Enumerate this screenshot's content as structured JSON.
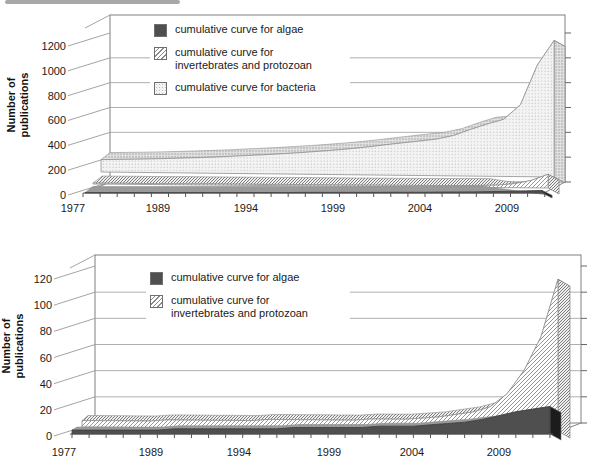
{
  "y_axis_title_lines": [
    "Number of",
    "publications"
  ],
  "chart_data": [
    {
      "type": "area",
      "style": "3d-layered-cumulative",
      "title": "",
      "ylabel": "Number of publications",
      "ylim": [
        0,
        1200
      ],
      "y_ticks": [
        0,
        200,
        400,
        600,
        800,
        1000,
        1200
      ],
      "x_tick_year_labels": [
        "1977",
        "1989",
        "1994",
        "1999",
        "2004",
        "2009"
      ],
      "grid": true,
      "legend_position": "inside-top-left",
      "series": [
        {
          "key": "bacteria",
          "name": "cumulative curve for bacteria",
          "pattern": "dots",
          "values": [
            100,
            103,
            106,
            110,
            115,
            120,
            126,
            132,
            140,
            148,
            156,
            165,
            175,
            186,
            198,
            212,
            228,
            245,
            262,
            278,
            295,
            325,
            375,
            420,
            460,
            580,
            900,
            1100
          ]
        },
        {
          "key": "invertebrates",
          "name": "cumulative curve for invertebrates and protozoan",
          "pattern": "hatch",
          "values": [
            8,
            8,
            8,
            8,
            8,
            9,
            9,
            9,
            9,
            9,
            9,
            10,
            10,
            10,
            10,
            10,
            10,
            11,
            11,
            11,
            12,
            13,
            14,
            16,
            20,
            32,
            60,
            110
          ]
        },
        {
          "key": "algae",
          "name": "cumulative curve for algae",
          "pattern": "solid-dark",
          "values": [
            3,
            3,
            3,
            3,
            3,
            3,
            4,
            4,
            4,
            4,
            4,
            4,
            4,
            5,
            5,
            5,
            5,
            5,
            6,
            6,
            6,
            7,
            8,
            9,
            11,
            14,
            17,
            20
          ]
        }
      ],
      "legend": [
        {
          "key": "algae",
          "lines": [
            "cumulative curve for algae"
          ]
        },
        {
          "key": "invertebrates",
          "lines": [
            "cumulative curve for",
            "invertebrates and protozoan"
          ]
        },
        {
          "key": "bacteria",
          "lines": [
            "cumulative curve for bacteria"
          ]
        }
      ]
    },
    {
      "type": "area",
      "style": "3d-layered-cumulative",
      "title": "",
      "ylabel": "Number of publications",
      "ylim": [
        0,
        120
      ],
      "y_ticks": [
        0,
        20,
        40,
        60,
        80,
        100,
        120
      ],
      "x_tick_year_labels": [
        "1977",
        "1989",
        "1994",
        "1999",
        "2004",
        "2009"
      ],
      "grid": true,
      "legend_position": "inside-top-left",
      "series": [
        {
          "key": "invertebrates",
          "name": "cumulative curve for invertebrates and protozoan",
          "pattern": "hatch",
          "values": [
            5,
            5,
            5,
            5,
            5,
            6,
            6,
            6,
            6,
            6,
            6,
            7,
            7,
            7,
            7,
            7,
            7,
            8,
            8,
            8,
            9,
            10,
            12,
            14,
            18,
            28,
            46,
            72,
            116
          ]
        },
        {
          "key": "algae",
          "name": "cumulative curve for algae",
          "pattern": "solid-dark",
          "values": [
            3,
            3,
            3,
            3,
            3,
            3,
            4,
            4,
            4,
            4,
            4,
            4,
            4,
            5,
            5,
            5,
            5,
            5,
            6,
            6,
            6,
            7,
            8,
            9,
            11,
            14,
            17,
            19,
            21
          ]
        }
      ],
      "legend": [
        {
          "key": "algae",
          "lines": [
            "cumulative curve for algae"
          ]
        },
        {
          "key": "invertebrates",
          "lines": [
            "cumulative curve for",
            "invertebrates and protozoan"
          ]
        }
      ]
    }
  ]
}
